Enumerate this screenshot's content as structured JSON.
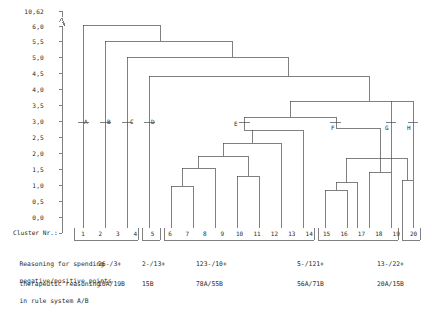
{
  "chart_data": {
    "type": "dendrogram",
    "title": "",
    "xlabel": "Cluster Nr.:",
    "ylabel": "",
    "ylim": [
      0.0,
      6.0
    ],
    "axis_break_top_value": "10,62",
    "grid": false,
    "legend": "none",
    "y_ticks": [
      "10,62",
      "6,0",
      "5,5",
      "5,0",
      "4,5",
      "4,0",
      "3,5",
      "3,0",
      "2,5",
      "2,0",
      "1,5",
      "1,0",
      "0,5",
      "0,0"
    ],
    "y_tick_values": [
      10.62,
      6.0,
      5.5,
      5.0,
      4.5,
      4.0,
      3.5,
      3.0,
      2.5,
      2.0,
      1.5,
      1.0,
      0.5,
      0.0
    ],
    "leaves": [
      "1",
      "2",
      "3",
      "4",
      "5",
      "6",
      "7",
      "8",
      "9",
      "10",
      "11",
      "12",
      "13",
      "14",
      "15",
      "16",
      "17",
      "18",
      "19",
      "20"
    ],
    "node_letters": [
      "A",
      "B",
      "C",
      "D",
      "E",
      "F",
      "G",
      "H"
    ],
    "node_letter_height": 3.0,
    "merges": [
      {
        "label": "A",
        "height": 10.62,
        "members": "1 vs all others"
      },
      {
        "label": "B",
        "height": 6.0,
        "members": "2 vs all others"
      },
      {
        "label": "C",
        "height": 5.45,
        "members": "3 vs all others"
      },
      {
        "label": "D",
        "height": 4.55,
        "members": "4 vs clusters 5-20"
      },
      {
        "label": "E",
        "height": 3.0,
        "members": "cluster 5-11 root"
      },
      {
        "label": "F",
        "height": 3.0,
        "members": "cluster 12-18 root"
      },
      {
        "label": "G",
        "height": 3.0,
        "members": "leaf 19"
      },
      {
        "label": "H",
        "height": 3.0,
        "members": "leaf 20"
      }
    ],
    "groups": [
      {
        "leaves": [
          "1",
          "2",
          "3"
        ],
        "negative_positive": "26-/3+",
        "rule_system": "10A/19B"
      },
      {
        "leaves": [
          "4"
        ],
        "negative_positive": "2-/13+",
        "rule_system": "15B"
      },
      {
        "leaves": [
          "5",
          "6",
          "7",
          "8",
          "9",
          "10",
          "11"
        ],
        "negative_positive": "123-/10+",
        "rule_system": "78A/55B"
      },
      {
        "leaves": [
          "12",
          "13",
          "14",
          "15",
          "16",
          "17",
          "18"
        ],
        "negative_positive": "5-/121+",
        "rule_system": "56A/71B"
      },
      {
        "leaves": [
          "19",
          "20"
        ],
        "negative_positive": "13-/22+",
        "rule_system": "20A/15B"
      }
    ]
  },
  "axis": {
    "caption": "Cluster Nr.:"
  },
  "footer": {
    "row1_line1": "Reasoning for spending",
    "row1_line2": "negative/positive points",
    "row2_line1": "therapeutic reasoning",
    "row2_line2": "in rule system A/B",
    "row1_values": [
      "26-/3+",
      "2-/13+",
      "123-/10+",
      "5-/121+",
      "13-/22+"
    ],
    "row2_values": [
      "10A/19B",
      "15B",
      "78A/55B",
      "56A/71B",
      "20A/15B"
    ]
  },
  "colors": {
    "line": "#4a4a4a",
    "text": "#2b2b2b",
    "background": "#ffffff"
  }
}
